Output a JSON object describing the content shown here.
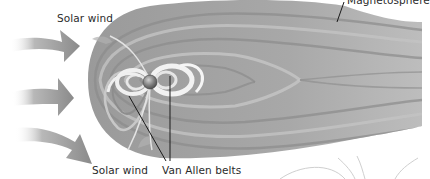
{
  "diagram": {
    "labels": {
      "solar_wind_top": "Solar wind",
      "solar_wind_bottom": "Solar wind",
      "van_allen_belts": "Van Allen belts",
      "magnetosphere": "Magnetosphere"
    },
    "elements": [
      {
        "name": "solar-wind-arrow",
        "count": 3,
        "direction": "left-to-right"
      },
      {
        "name": "magnetosphere",
        "shape": "bow-and-tail",
        "orientation": "tail extends right"
      },
      {
        "name": "earth",
        "position": "center-left of magnetosphere"
      },
      {
        "name": "van-allen-belts",
        "count": 2,
        "shape": "concentric lobes around Earth"
      },
      {
        "name": "field-lines",
        "style": "thin gray arcs",
        "position": "bottom right"
      }
    ],
    "colors": {
      "background": "#ffffff",
      "magnetosphere_fill": "#a6a6a6",
      "magnetosphere_band_dark": "#8c8c8c",
      "magnetosphere_band_light": "#c4c4c4",
      "belt_light": "#eeeeee",
      "arrow": "#8f8f8f",
      "label_text": "#2b2b2b",
      "leader_line": "#1a1a1a"
    }
  }
}
